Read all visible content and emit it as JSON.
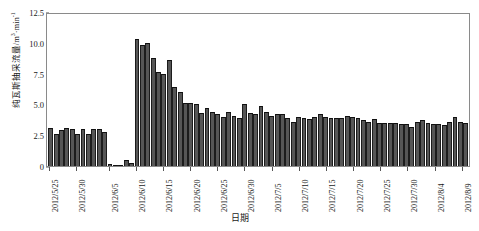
{
  "chart_data": {
    "type": "bar",
    "title": "",
    "xlabel": "日期",
    "ylabel": "纯瓦斯抽采流量/m³·min⁻¹",
    "ylabel_text": "纯瓦斯抽采流量/m",
    "ylabel_sup1": "3",
    "ylabel_mid": "·min",
    "ylabel_sup2": "-1",
    "ylim": [
      0,
      12.5
    ],
    "yticks": [
      0,
      2.5,
      5.0,
      7.5,
      10.0,
      12.5
    ],
    "ytick_labels": [
      "0",
      "2.5",
      "5.0",
      "7.5",
      "10.0",
      "12.5"
    ],
    "grid": false,
    "legend": "none",
    "bar_color": "#565656",
    "bar_edge_color": "#1c1c1c",
    "frame_color": "#8a8a8a",
    "xtick_labels": [
      "2012/5/25",
      "2012/5/30",
      "2012/6/5",
      "2012/6/10",
      "2012/6/15",
      "2012/6/20",
      "2012/6/25",
      "2012/6/30",
      "2012/7/5",
      "2012/7/10",
      "2012/7/15",
      "2012/7/20",
      "2012/7/25",
      "2012/7/30",
      "2012/8/4",
      "2012/8/9"
    ],
    "xtick_indices": [
      0,
      5,
      11,
      16,
      21,
      26,
      31,
      36,
      41,
      46,
      51,
      56,
      61,
      66,
      71,
      76
    ],
    "categories": [
      "2012/5/25",
      "2012/5/26",
      "2012/5/27",
      "2012/5/28",
      "2012/5/29",
      "2012/5/30",
      "2012/5/31",
      "2012/6/1",
      "2012/6/2",
      "2012/6/3",
      "2012/6/4",
      "2012/6/5",
      "2012/6/6",
      "2012/6/7",
      "2012/6/8",
      "2012/6/9",
      "2012/6/10",
      "2012/6/11",
      "2012/6/12",
      "2012/6/13",
      "2012/6/14",
      "2012/6/15",
      "2012/6/16",
      "2012/6/17",
      "2012/6/18",
      "2012/6/19",
      "2012/6/20",
      "2012/6/21",
      "2012/6/22",
      "2012/6/23",
      "2012/6/24",
      "2012/6/25",
      "2012/6/26",
      "2012/6/27",
      "2012/6/28",
      "2012/6/29",
      "2012/6/30",
      "2012/7/1",
      "2012/7/2",
      "2012/7/3",
      "2012/7/4",
      "2012/7/5",
      "2012/7/6",
      "2012/7/7",
      "2012/7/8",
      "2012/7/9",
      "2012/7/10",
      "2012/7/11",
      "2012/7/12",
      "2012/7/13",
      "2012/7/14",
      "2012/7/15",
      "2012/7/16",
      "2012/7/17",
      "2012/7/18",
      "2012/7/19",
      "2012/7/20",
      "2012/7/21",
      "2012/7/22",
      "2012/7/23",
      "2012/7/24",
      "2012/7/25",
      "2012/7/26",
      "2012/7/27",
      "2012/7/28",
      "2012/7/29",
      "2012/7/30",
      "2012/7/31",
      "2012/8/1",
      "2012/8/2",
      "2012/8/3",
      "2012/8/4",
      "2012/8/5",
      "2012/8/6",
      "2012/8/7",
      "2012/8/8",
      "2012/8/9",
      "2012/8/10"
    ],
    "values": [
      3.1,
      2.6,
      2.9,
      3.1,
      3.0,
      2.6,
      3.0,
      2.6,
      3.0,
      3.0,
      2.8,
      0.15,
      0.12,
      0.1,
      0.45,
      0.25,
      10.3,
      9.8,
      10.0,
      8.8,
      7.6,
      7.5,
      8.6,
      6.4,
      6.0,
      5.1,
      5.1,
      5.0,
      4.3,
      4.7,
      4.4,
      4.2,
      4.0,
      4.4,
      4.1,
      3.9,
      5.0,
      4.3,
      4.2,
      4.9,
      4.4,
      4.1,
      4.2,
      4.2,
      3.9,
      3.6,
      4.0,
      3.9,
      3.8,
      4.0,
      4.2,
      4.0,
      3.9,
      3.9,
      3.9,
      4.1,
      4.0,
      3.9,
      3.7,
      3.6,
      3.8,
      3.5,
      3.5,
      3.5,
      3.5,
      3.4,
      3.4,
      3.2,
      3.6,
      3.7,
      3.5,
      3.4,
      3.4,
      3.3,
      3.6,
      4.0,
      3.6,
      3.5
    ]
  }
}
